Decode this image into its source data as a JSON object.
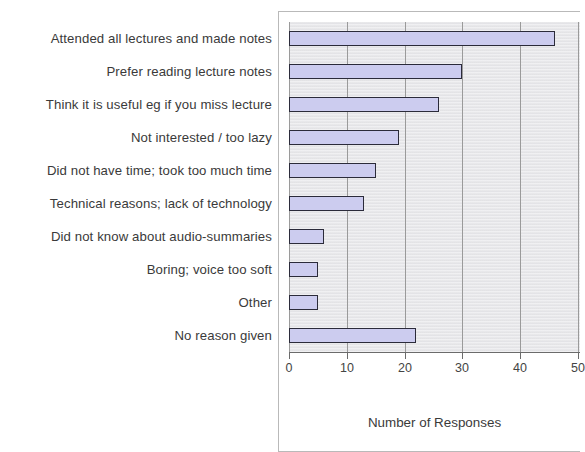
{
  "chart_data": {
    "type": "bar",
    "orientation": "horizontal",
    "title": "",
    "xlabel": "Number of Responses",
    "ylabel": "",
    "xlim": [
      0,
      50
    ],
    "xticks": [
      "0",
      "10",
      "20",
      "30",
      "40",
      "50"
    ],
    "grid": true,
    "legend": "none",
    "bar_fill_color": "#ccccef",
    "bar_border_color": "#2b2b3a",
    "plot_background_color": "#e9e9ec",
    "categories": [
      "Attended all lectures and made notes",
      "Prefer reading lecture notes",
      "Think it is useful eg if you miss lecture",
      "Not interested / too lazy",
      "Did not have time; took too much time",
      "Technical reasons; lack of technology",
      "Did not know about audio-summaries",
      "Boring; voice too soft",
      "Other",
      "No reason given"
    ],
    "values": [
      46,
      30,
      26,
      19,
      15,
      13,
      6,
      5,
      5,
      22
    ]
  }
}
